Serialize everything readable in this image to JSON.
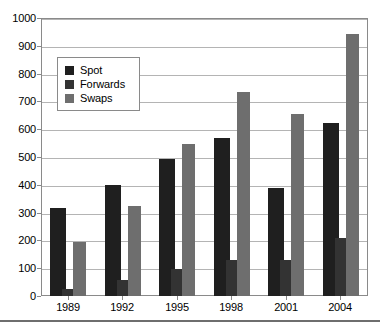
{
  "chart_data": {
    "type": "bar",
    "title": "",
    "subtitle": "",
    "xlabel": "",
    "ylabel": "",
    "categories": [
      "1989",
      "1992",
      "1995",
      "1998",
      "2001",
      "2004"
    ],
    "series": [
      {
        "name": "Spot",
        "values": [
          317,
          399,
          492,
          568,
          387,
          621
        ],
        "color": "#1f1f1f"
      },
      {
        "name": "Forwards",
        "values": [
          27,
          58,
          97,
          128,
          131,
          208
        ],
        "color": "#333333"
      },
      {
        "name": "Swaps",
        "values": [
          193,
          324,
          546,
          734,
          656,
          941
        ],
        "color": "#6e6e6e"
      }
    ],
    "ylim": [
      0,
      1000
    ],
    "yticks": [
      0,
      100,
      200,
      300,
      400,
      500,
      600,
      700,
      800,
      900,
      1000
    ],
    "ytick_labels": [
      "0",
      "100",
      "200",
      "300",
      "400",
      "500",
      "600",
      "700",
      "800",
      "900",
      "1000"
    ],
    "grid": true,
    "grid_axis": "y",
    "legend_position": "upper-left",
    "legend_entries": [
      "Spot",
      "Forwards",
      "Swaps"
    ]
  },
  "legend": {
    "items": [
      {
        "label": "Spot",
        "swatch": "legend-swatch-spot"
      },
      {
        "label": "Forwards",
        "swatch": "legend-swatch-forwards"
      },
      {
        "label": "Swaps",
        "swatch": "legend-swatch-swaps"
      }
    ]
  },
  "axes": {
    "y_tick_labels": [
      "1000",
      "900",
      "800",
      "700",
      "600",
      "500",
      "400",
      "300",
      "200",
      "100",
      "0"
    ],
    "x_tick_labels": [
      "1989",
      "1992",
      "1995",
      "1998",
      "2001",
      "2004"
    ]
  }
}
